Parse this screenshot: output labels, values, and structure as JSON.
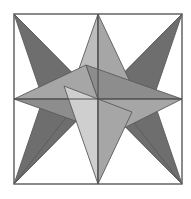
{
  "figure": {
    "canvas": {
      "width": 191,
      "height": 199,
      "background": "#ffffff"
    },
    "frame": {
      "name": "square-frame",
      "x": 14,
      "y": 14,
      "width": 168,
      "height": 170,
      "stroke": "#595959",
      "stroke_width": 1.4,
      "fill": "#ffffff"
    },
    "center": {
      "x": 98,
      "y": 99
    },
    "colors": {
      "dark_gray": "#6e6e6e",
      "mid_gray": "#8d8d8d",
      "light_gray": "#a6a6a6",
      "lighter_gray": "#bdbdbd",
      "lightest_gray": "#cfcfcf",
      "outline": "#5a5a5a",
      "background": "#ffffff"
    },
    "axis_lines": {
      "name": "center-cross",
      "stroke": "#4f4f4f",
      "stroke_width": 1.2,
      "horizontal": {
        "x1": 14,
        "y1": 99,
        "x2": 182,
        "y2": 99
      },
      "vertical": {
        "x1": 98,
        "y1": 14,
        "x2": 98,
        "y2": 184
      }
    },
    "star_corner": {
      "name": "dark-corner-star",
      "point_count": 4,
      "tips": [
        {
          "label": "top-left-tip",
          "x": 14,
          "y": 14
        },
        {
          "label": "top-right-tip",
          "x": 182,
          "y": 14
        },
        {
          "label": "bottom-right-tip",
          "x": 182,
          "y": 184
        },
        {
          "label": "bottom-left-tip",
          "x": 14,
          "y": 184
        }
      ]
    },
    "star_edge": {
      "name": "light-edge-star",
      "point_count": 4,
      "tips": [
        {
          "label": "top-tip",
          "x": 98,
          "y": 14
        },
        {
          "label": "right-tip",
          "x": 182,
          "y": 99
        },
        {
          "label": "bottom-tip",
          "x": 98,
          "y": 184
        },
        {
          "label": "left-tip",
          "x": 14,
          "y": 99
        }
      ]
    },
    "facets": [
      {
        "name": "facet-dark-tl-upper",
        "points": "14,14 98,99 72,89",
        "fill": "#6e6e6e"
      },
      {
        "name": "facet-dark-tl-lower",
        "points": "14,14 98,99 46,108",
        "fill": "#6e6e6e"
      },
      {
        "name": "facet-dark-tr-upper",
        "points": "182,14 98,99 124,89",
        "fill": "#6e6e6e"
      },
      {
        "name": "facet-dark-tr-lower",
        "points": "182,14 98,99 150,108",
        "fill": "#6e6e6e"
      },
      {
        "name": "facet-dark-bl-upper",
        "points": "14,184 98,99 46,90",
        "fill": "#6e6e6e"
      },
      {
        "name": "facet-dark-bl-lower",
        "points": "14,184 98,99 72,110",
        "fill": "#6e6e6e"
      },
      {
        "name": "facet-dark-br-upper",
        "points": "182,184 98,99 150,90",
        "fill": "#6e6e6e"
      },
      {
        "name": "facet-dark-br-lower",
        "points": "182,184 98,99 124,110",
        "fill": "#6e6e6e"
      },
      {
        "name": "facet-light-top-left",
        "points": "98,14 64,112 98,99",
        "fill": "#bdbdbd"
      },
      {
        "name": "facet-light-top-right",
        "points": "98,14 132,86 98,99",
        "fill": "#a6a6a6"
      },
      {
        "name": "facet-light-left-upper",
        "points": "14,99 86,65 98,99",
        "fill": "#a6a6a6"
      },
      {
        "name": "facet-light-left-lower",
        "points": "14,99 112,134 98,99",
        "fill": "#8d8d8d"
      },
      {
        "name": "facet-light-right-upper",
        "points": "182,99 86,65 98,99",
        "fill": "#8d8d8d"
      },
      {
        "name": "facet-light-right-lower",
        "points": "182,99 112,134 98,99",
        "fill": "#a6a6a6"
      },
      {
        "name": "facet-light-bottom-left",
        "points": "98,184 64,86 98,99",
        "fill": "#cfcfcf"
      },
      {
        "name": "facet-light-bottom-right",
        "points": "98,184 132,112 98,99",
        "fill": "#a6a6a6"
      }
    ]
  }
}
